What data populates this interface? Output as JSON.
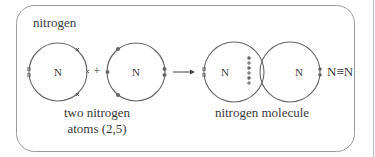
{
  "diagram": {
    "title": "nitrogen",
    "atom_left": {
      "symbol": "N"
    },
    "plus": "+",
    "atom_right": {
      "symbol": "N"
    },
    "atoms_caption_line1": "two nitrogen",
    "atoms_caption_line2": "atoms (2,5)",
    "molecule": {
      "left_symbol": "N",
      "right_symbol": "N"
    },
    "molecule_caption": "nitrogen molecule",
    "formula": "N≡N",
    "colors": {
      "stroke": "#666666",
      "electron": "#666666",
      "text": "#3a3a3a",
      "frame": "#999999"
    }
  }
}
